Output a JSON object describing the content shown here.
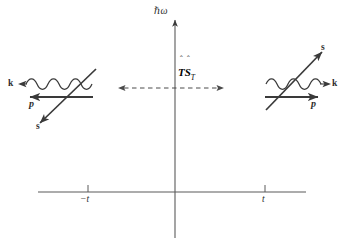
{
  "figure": {
    "background_color": "#ffffff",
    "ink_color": "#3a3a3a",
    "width": 340,
    "height": 245
  },
  "axes": {
    "vertical_axis_label": "ℏω",
    "horizontal_axis_label": "",
    "ticks": [
      {
        "label": "−t",
        "x": 88
      },
      {
        "label": "t",
        "x": 265
      }
    ]
  },
  "center": {
    "operator_label": "TS",
    "operator_subscript": "T",
    "operator_hat_left": "ˆ",
    "operator_hat_right": "ˆ",
    "arrow_type": "dashed-double-headed"
  },
  "left_diagram": {
    "name": "incoming-state-diagram",
    "labels": {
      "wavevector": "k",
      "momentum": "p",
      "spin": "s"
    },
    "wavevector_direction": "left",
    "momentum_direction": "left",
    "spin_direction": "down-left"
  },
  "right_diagram": {
    "name": "time-reversed-state-diagram",
    "labels": {
      "wavevector": "k",
      "momentum": "p",
      "spin": "s"
    },
    "wavevector_direction": "right",
    "momentum_direction": "right",
    "spin_direction": "up-right"
  }
}
